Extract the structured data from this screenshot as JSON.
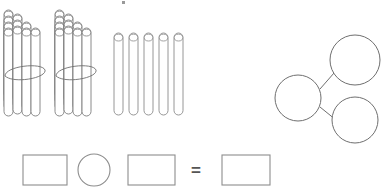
{
  "worksheet": {
    "title": "Place value sticks with number bond and equation",
    "background_color": "#ffffff",
    "stroke_color": "#808080",
    "dark_stroke_color": "#5a5a5a",
    "equals_label": "="
  },
  "manipulatives": {
    "bundles": {
      "name": "bundles-of-ten",
      "count": 2,
      "sticks_per_bundle": 10,
      "items": [
        {
          "label": "bundle-1",
          "x": 4,
          "y": 10,
          "sticks": 10,
          "banded": true
        },
        {
          "label": "bundle-2",
          "x": 55,
          "y": 10,
          "sticks": 10,
          "banded": true
        }
      ]
    },
    "loose_sticks": {
      "name": "loose-ones",
      "count": 5,
      "x": 114,
      "y": 33,
      "items": [
        {
          "label": "stick-1",
          "x": 114
        },
        {
          "label": "stick-2",
          "x": 129
        },
        {
          "label": "stick-3",
          "x": 144
        },
        {
          "label": "stick-4",
          "x": 159
        },
        {
          "label": "stick-5",
          "x": 174
        }
      ]
    }
  },
  "number_bond": {
    "name": "number-bond",
    "whole": {
      "label": "whole-circle",
      "cx": 298,
      "cy": 98,
      "r": 23,
      "value": ""
    },
    "parts": [
      {
        "label": "part-circle-top",
        "cx": 355,
        "cy": 60,
        "r": 25,
        "value": ""
      },
      {
        "label": "part-circle-bottom",
        "cx": 355,
        "cy": 120,
        "r": 23,
        "value": ""
      }
    ],
    "connectors": [
      {
        "label": "connector-top",
        "x1": 320,
        "y1": 89,
        "x2": 334,
        "y2": 73
      },
      {
        "label": "connector-bottom",
        "x1": 320,
        "y1": 107,
        "x2": 336,
        "y2": 120
      }
    ]
  },
  "equation": {
    "name": "equation-row",
    "slots": [
      {
        "label": "first-addend-box",
        "type": "rect",
        "x": 23,
        "y": 155,
        "w": 44,
        "h": 30,
        "value": ""
      },
      {
        "label": "operator-circle",
        "type": "circle",
        "cx": 94,
        "cy": 170,
        "r": 16,
        "value": ""
      },
      {
        "label": "second-addend-box",
        "type": "rect",
        "x": 128,
        "y": 155,
        "w": 47,
        "h": 30,
        "value": ""
      },
      {
        "label": "equals-sign",
        "type": "text",
        "x": 196,
        "y": 170,
        "value": "="
      },
      {
        "label": "sum-box",
        "type": "rect",
        "x": 222,
        "y": 155,
        "w": 48,
        "h": 30,
        "value": ""
      }
    ]
  },
  "artifact": {
    "name": "top-speck",
    "x": 122,
    "y": 1,
    "w": 3,
    "h": 3
  }
}
